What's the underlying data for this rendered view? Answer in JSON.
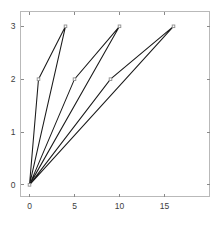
{
  "chart_data": {
    "type": "line",
    "title": "",
    "xlabel": "",
    "ylabel": "",
    "xlim": [
      -1,
      20
    ],
    "ylim": [
      -0.22,
      3.28
    ],
    "xticks": [
      0,
      5,
      10,
      15
    ],
    "yticks": [
      0,
      1,
      2,
      3
    ],
    "xticklabels": [
      "0",
      "5",
      "10",
      "15"
    ],
    "yticklabels": [
      "0",
      "1",
      "2",
      "3"
    ],
    "grid": false,
    "legend": null,
    "marker": "open-square",
    "line_color": "#1a1a1a",
    "frame_color": "#b9b9b9",
    "background": "#ffffff",
    "series": [
      {
        "name": "loop-1",
        "x": [
          0,
          1,
          4,
          0
        ],
        "y": [
          0,
          2,
          3,
          0
        ]
      },
      {
        "name": "loop-2",
        "x": [
          0,
          5,
          10,
          0
        ],
        "y": [
          0,
          2,
          3,
          0
        ]
      },
      {
        "name": "loop-3",
        "x": [
          0,
          9,
          16,
          0
        ],
        "y": [
          0,
          2,
          3,
          0
        ]
      }
    ],
    "markers": [
      {
        "x": 0,
        "y": 0
      },
      {
        "x": 1,
        "y": 2
      },
      {
        "x": 4,
        "y": 3
      },
      {
        "x": 5,
        "y": 2
      },
      {
        "x": 10,
        "y": 3
      },
      {
        "x": 9,
        "y": 2
      },
      {
        "x": 16,
        "y": 3
      }
    ]
  }
}
